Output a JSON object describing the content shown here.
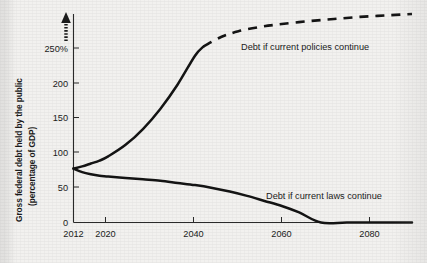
{
  "chart_data": {
    "type": "line",
    "title": "",
    "subtitle": "",
    "ylabel_line1": "Gross federal debt held by the public",
    "ylabel_line2": "(percentage of GDP)",
    "xlabel": "",
    "xlim": [
      2012,
      2090
    ],
    "ylim": [
      0,
      290
    ],
    "grid": false,
    "legend_position": "inline-annotations",
    "axis_break_above": "250%",
    "yticks": [
      0,
      50,
      100,
      150,
      200,
      250
    ],
    "ytick_labels": [
      "0",
      "50",
      "100",
      "150",
      "200",
      "250%"
    ],
    "xticks": [
      2012,
      2020,
      2040,
      2060,
      2080
    ],
    "xtick_labels": [
      "2012",
      "2020",
      "2040",
      "2060",
      "2080"
    ],
    "series": [
      {
        "name": "Debt if current policies continue",
        "style": "solid-then-dashed",
        "projection_starts": 2042,
        "x": [
          2012,
          2014,
          2016,
          2018,
          2020,
          2024,
          2028,
          2032,
          2036,
          2040,
          2042,
          2046,
          2050,
          2055,
          2060,
          2066,
          2072,
          2078,
          2084,
          2090
        ],
        "values": [
          75,
          78,
          82,
          86,
          92,
          108,
          130,
          158,
          192,
          232,
          245,
          258,
          266,
          272,
          276,
          280,
          283,
          286,
          288,
          290
        ]
      },
      {
        "name": "Debt if current laws continue",
        "style": "solid",
        "x": [
          2012,
          2014,
          2016,
          2018,
          2020,
          2024,
          2028,
          2032,
          2036,
          2040,
          2044,
          2048,
          2052,
          2056,
          2060,
          2064,
          2069,
          2075,
          2082,
          2090
        ],
        "values": [
          75,
          70,
          67,
          65,
          64,
          62,
          60,
          58,
          55,
          52,
          48,
          43,
          37,
          30,
          23,
          14,
          0,
          0,
          0,
          0
        ]
      }
    ],
    "annotations": [
      {
        "text": "Debt if current policies continue",
        "year": 2052,
        "value": 250
      },
      {
        "text": "Debt if current laws continue",
        "year": 2060,
        "value": 30
      }
    ],
    "colors": {
      "line": "#141414",
      "axis": "#2a2a2a",
      "background": "#f2f1ef",
      "text": "#1b1b1b"
    }
  }
}
